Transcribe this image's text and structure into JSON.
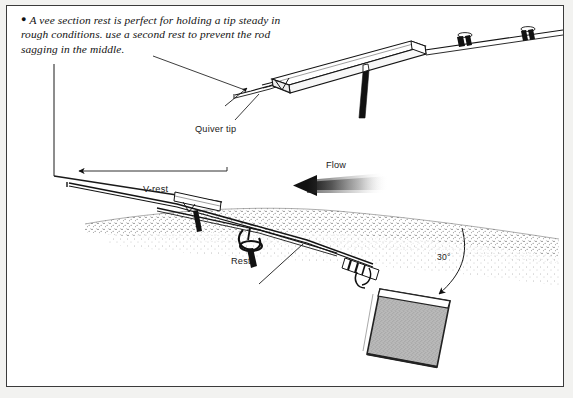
{
  "page": {
    "background_color": "#f2f2f0",
    "panel_color": "#ffffff",
    "border_color": "#3b3b3b",
    "ink_color": "#111111"
  },
  "caption": {
    "bullet": "●",
    "text": "A vee section rest is perfect for holding a tip steady in rough conditions. use a second rest to prevent the rod sagging in the middle."
  },
  "labels": {
    "quiver_tip": "Quiver tip",
    "v_rest": "V-rest",
    "flow": "Flow",
    "rest": "Rest",
    "angle": "30°"
  },
  "diagram": {
    "type": "technical-illustration",
    "elements": [
      "enlarged vee-rest inset with rod seated in the channel",
      "rod blank with two line guides extending to the right",
      "support pole beneath the vee rest",
      "leader line from caption to the vee rest inset",
      "vertical and horizontal guide lines with left pointing arrow",
      "stippled water surface with far bank",
      "front rest and rear rest holding the rod over the water",
      "rod butt with reel seat",
      "textured grey keep-net bag at the water edge",
      "curved arrow marking the thirty degree rod angle",
      "gradient flow arrow pointing left"
    ]
  }
}
